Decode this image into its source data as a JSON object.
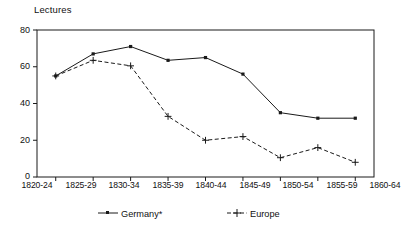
{
  "chart_data": {
    "type": "line",
    "title": "Lectures",
    "xlabel": "",
    "ylabel": "Lectures",
    "ylim": [
      0,
      80
    ],
    "yticks": [
      0,
      20,
      40,
      60,
      80
    ],
    "grid": false,
    "legend_position": "bottom",
    "categories": [
      "1820-24",
      "1825-29",
      "1830-34",
      "1835-39",
      "1840-44",
      "1845-49",
      "1850-54",
      "1855-59",
      "1860-64"
    ],
    "series": [
      {
        "name": "Germany*",
        "style": "solid",
        "marker": "square",
        "color": "#1a1a1a",
        "values": [
          55,
          67,
          71,
          63.5,
          65,
          56,
          35,
          32,
          32
        ]
      },
      {
        "name": "Europe",
        "style": "dashed",
        "marker": "plus",
        "color": "#1a1a1a",
        "values": [
          55,
          63.5,
          60.5,
          33,
          20,
          22,
          10.5,
          16,
          8
        ]
      }
    ]
  },
  "axis": {
    "y_title": "Lectures",
    "y_tick_labels": [
      "80",
      "60",
      "40",
      "20",
      "0"
    ],
    "x_tick_labels": [
      "1820-24",
      "1825-29",
      "1830-34",
      "1835-39",
      "1840-44",
      "1845-49",
      "1850-54",
      "1855-59",
      "1860-64"
    ]
  },
  "legend": {
    "items": [
      {
        "label": "Germany*",
        "marker": "square-marker",
        "line": "solid"
      },
      {
        "label": "Europe",
        "marker": "plus-marker",
        "line": "dashed"
      }
    ]
  }
}
